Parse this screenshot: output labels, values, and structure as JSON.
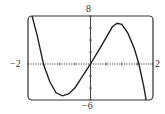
{
  "chart_data": {
    "type": "line",
    "title": "",
    "xlabel": "",
    "ylabel": "",
    "xlim": [
      -2,
      2
    ],
    "ylim": [
      -6,
      8
    ],
    "grid": false,
    "tick_labels": {
      "x_min": "−2",
      "x_max": "2",
      "y_min": "−6",
      "y_max": "8"
    },
    "series": [
      {
        "name": "f(x)",
        "x": [
          -1.87,
          -1.7,
          -1.5,
          -1.3,
          -1.1,
          -0.9,
          -0.7,
          -0.5,
          -0.3,
          0.0,
          0.3,
          0.5,
          0.7,
          0.85,
          1.0,
          1.2,
          1.4,
          1.55,
          1.7,
          1.78
        ],
        "y": [
          8.0,
          4.6,
          -0.1,
          -3.0,
          -4.8,
          -5.3,
          -5.0,
          -4.0,
          -2.4,
          0.0,
          2.6,
          4.4,
          6.2,
          6.8,
          6.6,
          5.1,
          2.6,
          0.0,
          -3.6,
          -6.0
        ]
      }
    ]
  },
  "labels": {
    "y_top": "8",
    "y_bottom": "−6",
    "x_left": "−2",
    "x_right": "2"
  }
}
